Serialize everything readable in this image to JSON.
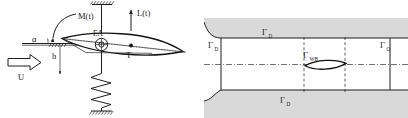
{
  "figure": {
    "width": 408,
    "height": 118,
    "background": "#ffffff",
    "panels": [
      {
        "id": "aeroelastic-section",
        "title": "Two degree of freedom pitch-plunge airfoil section"
      },
      {
        "id": "fluid-domain",
        "title": "Computational fluid domain with boundary labels"
      }
    ]
  },
  "left_panel": {
    "labels": {
      "moment": "M(t)",
      "lift": "L(t)",
      "angle_of_attack": "α",
      "plunge": "h",
      "freestream": "U",
      "elastic_axis": "EA",
      "center_of_mass": "T"
    },
    "elements": {
      "torsional_rod": "torsional-spring-rod",
      "coil_spring": "plunge-coil-spring",
      "ground_top": "ceiling-fixed-support",
      "ground_bottom": "floor-fixed-support",
      "airfoil": "airfoil-section",
      "chord_line": "chord-dotted-line",
      "reference_line": "horizontal-reference-line"
    },
    "colors": {
      "line": "#1f1f1f",
      "accent": "#111111"
    }
  },
  "right_panel": {
    "labels": {
      "inlet": "Γ",
      "inlet_sub": "D",
      "top_wall": "Γ",
      "top_wall_sub": "D",
      "bottom_wall": "Γ",
      "bottom_wall_sub": "D",
      "body": "Γ",
      "body_sub": "WB",
      "outlet": "Γ",
      "outlet_sub": "O"
    },
    "elements": {
      "upper_wall": "upper-channel-wall",
      "lower_wall": "lower-channel-wall",
      "centerline": "domain-centerline",
      "airfoil_body": "immersed-airfoil-body",
      "left_marker": "left-dashed-marker",
      "right_marker": "right-dashed-marker",
      "inlet_boundary": "inlet-boundary-line",
      "outlet_boundary": "outlet-boundary-line"
    },
    "colors": {
      "wall_fill": "#d9d9d9",
      "line": "#1f1f1f",
      "dashed": "#2b2b2b"
    }
  }
}
